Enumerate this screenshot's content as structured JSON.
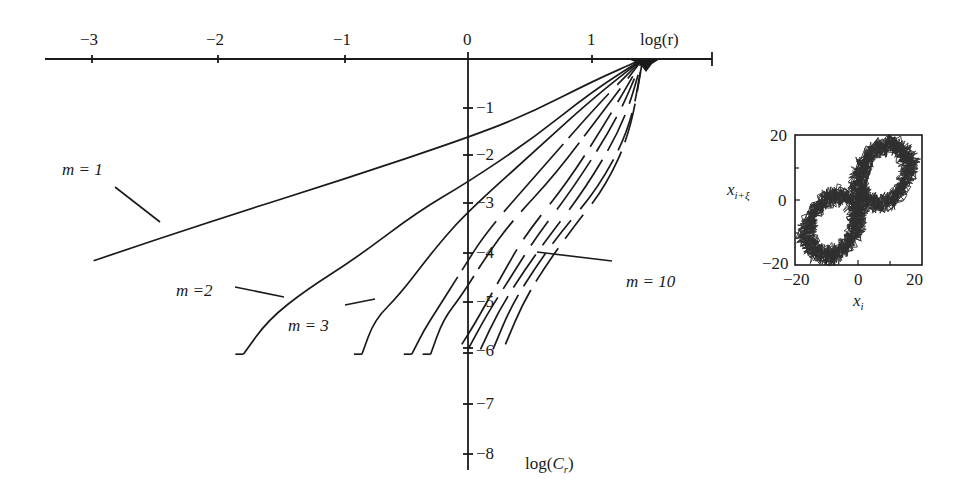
{
  "chart_data": [
    {
      "type": "line",
      "title": "",
      "xlabel": "log(r)",
      "ylabel": "log(C_r)",
      "xlim": [
        -3.4,
        2.0
      ],
      "ylim": [
        -8.2,
        0
      ],
      "grid": false,
      "legend": "inline labels",
      "x_ticks": [
        "-3",
        "-2",
        "-1",
        "0",
        "1"
      ],
      "y_ticks": [
        "-1",
        "-2",
        "-3",
        "-4",
        "-5",
        "-6",
        "-7",
        "-8"
      ],
      "annotations": [
        "m = 1",
        "m =2",
        "m = 3",
        "m = 10"
      ],
      "series": [
        {
          "name": "m = 1",
          "x": [
            -3.0,
            -2.0,
            -1.0,
            0.0,
            0.5,
            1.0,
            1.4
          ],
          "y": [
            -4.1,
            -3.25,
            -2.45,
            -1.6,
            -1.1,
            -0.45,
            0.0
          ]
        },
        {
          "name": "m = 2",
          "x": [
            -1.8,
            -1.6,
            -1.3,
            -0.9,
            -0.4,
            0.0,
            0.5,
            1.0,
            1.4
          ],
          "y": [
            -6.0,
            -5.3,
            -4.7,
            -4.05,
            -3.1,
            -2.5,
            -1.65,
            -0.65,
            0.0
          ]
        },
        {
          "name": "m = 3",
          "x": [
            -0.85,
            -0.75,
            -0.55,
            -0.25,
            0.0,
            0.5,
            1.0,
            1.4
          ],
          "y": [
            -6.0,
            -5.3,
            -4.8,
            -3.8,
            -3.1,
            -1.95,
            -0.8,
            0.0
          ]
        },
        {
          "name": "m = 4",
          "x": [
            -0.45,
            -0.35,
            -0.25,
            -0.05,
            0.15,
            0.6,
            1.05,
            1.4
          ],
          "y": [
            -6.0,
            -5.5,
            -5.1,
            -4.3,
            -3.5,
            -2.2,
            -0.9,
            0.0
          ]
        },
        {
          "name": "m = 5",
          "x": [
            -0.3,
            -0.2,
            -0.05,
            0.15,
            0.35,
            0.7,
            1.1,
            1.4
          ],
          "y": [
            -6.0,
            -5.3,
            -4.8,
            -4.0,
            -3.3,
            -2.35,
            -1.0,
            0.0
          ]
        },
        {
          "name": "m = 6",
          "x": [
            -0.05,
            0.05,
            0.25,
            0.45,
            0.8,
            1.15,
            1.4
          ],
          "y": [
            -5.8,
            -5.4,
            -4.5,
            -3.6,
            -2.5,
            -1.1,
            0.0
          ]
        },
        {
          "name": "m = 7",
          "x": [
            0.0,
            0.15,
            0.35,
            0.55,
            0.85,
            1.2,
            1.4
          ],
          "y": [
            -5.9,
            -5.2,
            -4.4,
            -3.6,
            -2.6,
            -1.2,
            0.0
          ]
        },
        {
          "name": "m = 8",
          "x": [
            0.1,
            0.25,
            0.45,
            0.65,
            0.95,
            1.25,
            1.4
          ],
          "y": [
            -5.9,
            -5.1,
            -4.3,
            -3.6,
            -2.6,
            -1.3,
            0.0
          ]
        },
        {
          "name": "m = 9",
          "x": [
            0.2,
            0.35,
            0.55,
            0.75,
            1.05,
            1.3,
            1.4
          ],
          "y": [
            -5.9,
            -5.0,
            -4.2,
            -3.5,
            -2.6,
            -1.4,
            0.0
          ]
        },
        {
          "name": "m = 10",
          "x": [
            0.3,
            0.45,
            0.65,
            0.85,
            1.1,
            1.3,
            1.4
          ],
          "y": [
            -5.8,
            -4.9,
            -4.1,
            -3.4,
            -2.6,
            -1.5,
            0.0
          ]
        }
      ]
    },
    {
      "type": "scatter",
      "title": "",
      "xlabel": "x_i",
      "ylabel": "x_{i+ξ}",
      "xlim": [
        -20,
        20
      ],
      "ylim": [
        -20,
        20
      ],
      "x_ticks": [
        "-20",
        "0",
        "20"
      ],
      "y_ticks": [
        "-20",
        "0",
        "20"
      ],
      "description": "Delay-embedded attractor (figure-eight / butterfly shape) with lobes centered near (-8,-8) and (8,8)"
    }
  ],
  "main": {
    "x_tick_labels": [
      "−3",
      "−2",
      "−1",
      "0",
      "1"
    ],
    "x_axis_label": "log(r)",
    "y_tick_labels": [
      "−1",
      "−2",
      "−3",
      "−4",
      "−5",
      "−6",
      "−7",
      "−8"
    ],
    "y_axis_label_prefix": "log(",
    "y_axis_label_var": "C",
    "y_axis_label_sub": "r",
    "y_axis_label_suffix": ")",
    "labels": {
      "m1": "m = 1",
      "m2": "m =2",
      "m3": "m = 3",
      "m10": "m = 10"
    }
  },
  "inset": {
    "x_tick_labels": [
      "−20",
      "0",
      "20"
    ],
    "y_tick_labels": [
      "20",
      "0",
      "−20"
    ],
    "x_label_var": "x",
    "x_label_sub": "i",
    "y_label_var": "x",
    "y_label_sub": "i+ξ"
  },
  "colors": {
    "ink": "#1a1a1a",
    "background": "#ffffff"
  }
}
